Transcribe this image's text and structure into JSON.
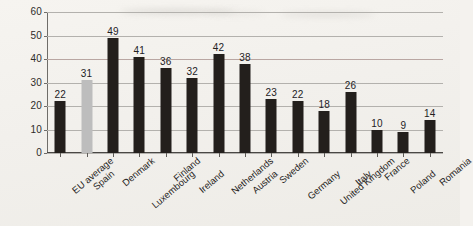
{
  "chart_data": {
    "type": "bar",
    "title": "",
    "subtitle": "",
    "xlabel": "",
    "ylabel": "",
    "ylim": [
      0,
      60
    ],
    "ytick_step": 10,
    "yticks": [
      0,
      10,
      20,
      30,
      40,
      50,
      60
    ],
    "grid": true,
    "legend": "none",
    "categories": [
      "EU average",
      "Spain",
      "Denmark",
      "Luxembourg",
      "Finland",
      "Ireland",
      "Netherlands",
      "Austria",
      "Sweden",
      "Germany",
      "United Kingdom",
      "Italy",
      "France",
      "Poland",
      "Romania"
    ],
    "values": [
      22,
      31,
      49,
      41,
      36,
      32,
      42,
      38,
      23,
      22,
      18,
      26,
      10,
      9,
      14
    ],
    "bar_colors": [
      "#231f1c",
      "#bdbdbd",
      "#231f1c",
      "#231f1c",
      "#231f1c",
      "#231f1c",
      "#231f1c",
      "#231f1c",
      "#231f1c",
      "#231f1c",
      "#231f1c",
      "#231f1c",
      "#231f1c",
      "#231f1c",
      "#231f1c"
    ],
    "highlight_category": "Spain",
    "colors": {
      "bar_default": "#231f1c",
      "bar_highlight": "#bdbdbd",
      "gridline": "#b3b1ad",
      "gridline_accent": "#b9a6a2",
      "axis": "#4a4845",
      "text": "#262422",
      "background": "#f2f0ec"
    },
    "data_labels_shown": true
  }
}
